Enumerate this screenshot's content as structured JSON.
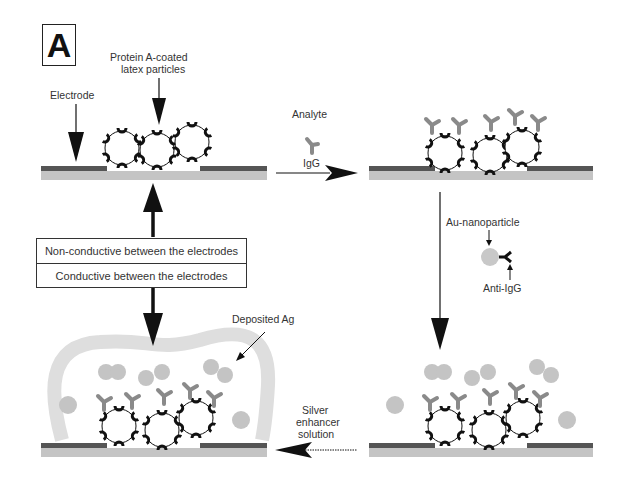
{
  "panel": {
    "letter": "A"
  },
  "labels": {
    "protein_a": "Protein A-coated",
    "protein_a_2": "latex particles",
    "electrode": "Electrode",
    "analyte": "Analyte",
    "igg": "IgG",
    "au_nanoparticle": "Au-nanoparticle",
    "anti_igg": "Anti-IgG",
    "deposited_ag": "Deposited Ag",
    "silver_1": "Silver",
    "silver_2": "enhancer",
    "silver_3": "solution"
  },
  "state_box": {
    "non_conductive": "Non-conductive between the electrodes",
    "conductive": "Conductive between the electrodes"
  },
  "colors": {
    "electrode": "#555555",
    "substrate": "#c4c4c4",
    "igg": "#8a8a8a",
    "gold": "#c8c8c8",
    "silver_deposit": "#dedede"
  }
}
